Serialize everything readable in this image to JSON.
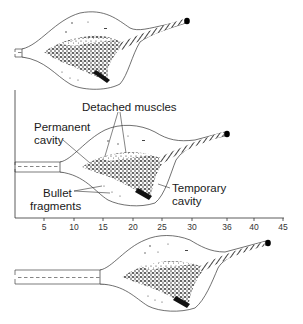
{
  "diagram": {
    "type": "wound ballistics cavity diagram",
    "stages": [
      "early penetration",
      "maximum temporary cavity",
      "exit / late"
    ],
    "labels": {
      "detached_muscles": "Detached muscles",
      "permanent_cavity_line1": "Permanent",
      "permanent_cavity_line2": "cavity",
      "bullet_fragments_line1": "Bullet",
      "bullet_fragments_line2": "fragments",
      "temporary_cavity_line1": "Temporary",
      "temporary_cavity_line2": "cavity"
    },
    "axis": {
      "ticks": [
        "5",
        "10",
        "15",
        "20",
        "25",
        "30",
        "36",
        "40",
        "45"
      ]
    },
    "colors": {
      "ink": "#1a1a1a",
      "background": "#ffffff"
    }
  }
}
